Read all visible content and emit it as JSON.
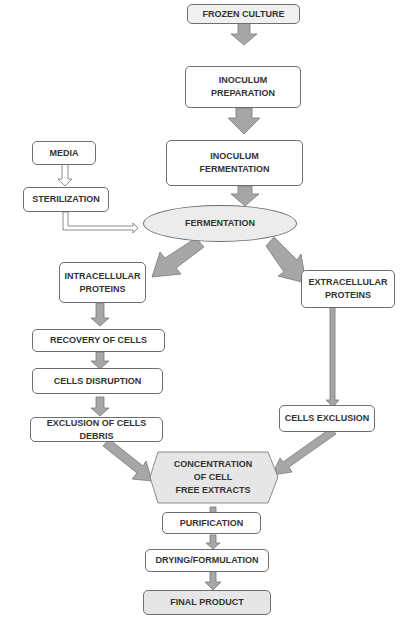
{
  "diagram": {
    "type": "flowchart",
    "colors": {
      "arrow_fill": "#a6a6a6",
      "arrow_stroke": "#7a7a7a",
      "box_border": "#6e6e6e",
      "shaded_fill": "#e6e6e6",
      "text": "#333333"
    },
    "nodes": {
      "frozen_culture": "FROZEN CULTURE",
      "inoculum_preparation": "INOCULUM\nPREPARATION",
      "inoculum_fermentation": "INOCULUM\nFERMENTATION",
      "media": "MEDIA",
      "sterilization": "STERILIZATION",
      "fermentation": "FERMENTATION",
      "intracellular_proteins": "INTRACELLULAR\nPROTEINS",
      "extracellular_proteins": "EXTRACELLULAR\nPROTEINS",
      "recovery_of_cells": "RECOVERY OF CELLS",
      "cells_disruption": "CELLS DISRUPTION",
      "exclusion_of_cells_debris": "EXCLUSION OF CELLS DEBRIS",
      "cells_exclusion": "CELLS EXCLUSION",
      "concentration": "CONCENTRATION\nOF CELL\nFREE EXTRACTS",
      "purification": "PURIFICATION",
      "drying_formulation": "DRYING/FORMULATION",
      "final_product": "FINAL PRODUCT"
    },
    "edges": [
      [
        "frozen_culture",
        "inoculum_preparation"
      ],
      [
        "inoculum_preparation",
        "inoculum_fermentation"
      ],
      [
        "inoculum_fermentation",
        "fermentation"
      ],
      [
        "media",
        "sterilization"
      ],
      [
        "sterilization",
        "fermentation"
      ],
      [
        "fermentation",
        "intracellular_proteins"
      ],
      [
        "fermentation",
        "extracellular_proteins"
      ],
      [
        "intracellular_proteins",
        "recovery_of_cells"
      ],
      [
        "recovery_of_cells",
        "cells_disruption"
      ],
      [
        "cells_disruption",
        "exclusion_of_cells_debris"
      ],
      [
        "extracellular_proteins",
        "cells_exclusion"
      ],
      [
        "exclusion_of_cells_debris",
        "concentration"
      ],
      [
        "cells_exclusion",
        "concentration"
      ],
      [
        "concentration",
        "purification"
      ],
      [
        "purification",
        "drying_formulation"
      ],
      [
        "drying_formulation",
        "final_product"
      ]
    ]
  }
}
